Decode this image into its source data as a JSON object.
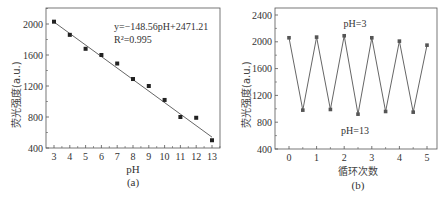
{
  "figure": {
    "panels": [
      "(a)",
      "(b)"
    ]
  },
  "chart_data": [
    {
      "type": "scatter",
      "panel_label": "(a)",
      "title": "",
      "xlabel": "pH",
      "ylabel": "荧光强度(a.u.)",
      "x": [
        3,
        4,
        5,
        6,
        7,
        8,
        9,
        10,
        11,
        12,
        13
      ],
      "values": [
        2030,
        1860,
        1680,
        1600,
        1490,
        1290,
        1200,
        1020,
        800,
        790,
        500
      ],
      "fit_line": {
        "slope": -148.56,
        "intercept": 2471.21,
        "x_range": [
          3,
          13
        ]
      },
      "annotations": [
        "y=−148.56pH+2471.21",
        "R²=0.995"
      ],
      "xticks": [
        3,
        4,
        5,
        6,
        7,
        8,
        9,
        10,
        11,
        12,
        13
      ],
      "yticks": [
        400,
        800,
        1200,
        1600,
        2000
      ],
      "xlim": [
        2.5,
        13.5
      ],
      "ylim": [
        400,
        2200
      ],
      "grid": false,
      "legend": null
    },
    {
      "type": "line",
      "panel_label": "(b)",
      "title": "",
      "xlabel": "循环次数",
      "ylabel": "荧光强度(a.u.)",
      "x": [
        0,
        0.5,
        1,
        1.5,
        2,
        2.5,
        3,
        3.5,
        4,
        4.5,
        5
      ],
      "values": [
        2060,
        980,
        2070,
        990,
        2090,
        920,
        2060,
        960,
        2010,
        950,
        1950
      ],
      "annotations": [
        "pH=3",
        "pH=13"
      ],
      "xticks": [
        0,
        1,
        2,
        3,
        4,
        5
      ],
      "yticks": [
        400,
        800,
        1200,
        1600,
        2000,
        2400
      ],
      "xlim": [
        -0.5,
        5.4
      ],
      "ylim": [
        400,
        2500
      ],
      "grid": false,
      "legend": null
    }
  ],
  "colors": {
    "axis": "#555555",
    "marker": "#222222",
    "line": "#666666"
  }
}
